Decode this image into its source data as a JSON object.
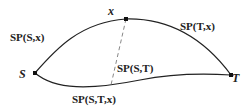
{
  "diagram": {
    "nodes": [
      {
        "id": "S",
        "label": "S",
        "x": 35,
        "y": 73
      },
      {
        "id": "x",
        "label": "x",
        "x": 126,
        "y": 19
      },
      {
        "id": "T",
        "label": "T",
        "x": 231,
        "y": 75
      }
    ],
    "edges": [
      {
        "id": "sp-s-x",
        "label": "SP(S,x)",
        "from": "S",
        "to": "x",
        "style": "solid"
      },
      {
        "id": "sp-t-x",
        "label": "SP(T,x)",
        "from": "x",
        "to": "T",
        "style": "solid"
      },
      {
        "id": "sp-s-t-x",
        "label": "SP(S,T,x)",
        "from": "S",
        "to": "T",
        "style": "solid"
      },
      {
        "id": "dashed-x",
        "label": "",
        "from": "x",
        "to": "SP(S,T)",
        "style": "dashed"
      }
    ],
    "annotations": {
      "sp_s_t": "SP(S,T)"
    },
    "colors": {
      "line": "#222222",
      "background": "#ffffff"
    }
  }
}
